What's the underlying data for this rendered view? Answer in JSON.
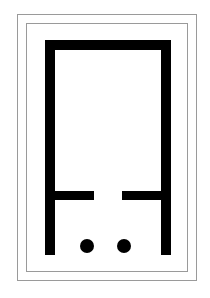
{
  "figure": {
    "colors": {
      "background": "#ffffff",
      "frame_border": "#9a9a9a",
      "glyph": "#000000"
    },
    "frames": [
      {
        "name": "outer-frame",
        "x": 17,
        "y": 14,
        "w": 180,
        "h": 267
      },
      {
        "name": "inner-frame",
        "x": 26,
        "y": 23,
        "w": 162,
        "h": 249
      }
    ],
    "glyph": {
      "top_bar": {
        "x": 45,
        "y": 40,
        "w": 126,
        "h": 10
      },
      "left_leg": {
        "x": 45,
        "y": 40,
        "w": 10,
        "h": 215
      },
      "right_leg": {
        "x": 161,
        "y": 40,
        "w": 10,
        "h": 215
      },
      "left_stub": {
        "x": 55,
        "y": 191,
        "w": 39,
        "h": 9
      },
      "right_stub": {
        "x": 122,
        "y": 191,
        "w": 39,
        "h": 9
      },
      "dots": [
        {
          "cx": 87,
          "cy": 246,
          "r": 7
        },
        {
          "cx": 124,
          "cy": 246,
          "r": 7
        }
      ]
    }
  }
}
